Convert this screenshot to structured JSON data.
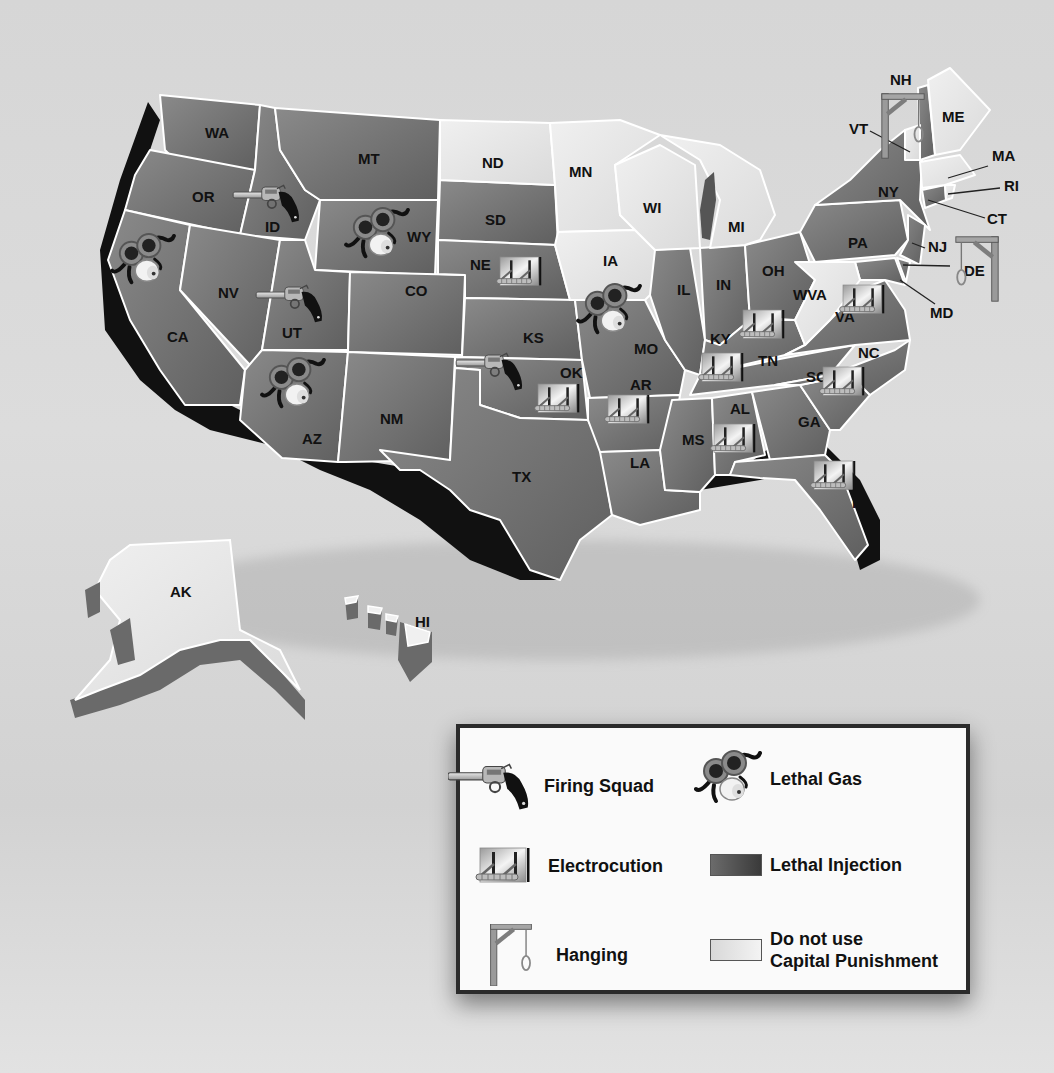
{
  "colors": {
    "background": "#d8d8d8",
    "lethal_injection": "#7d7d7d",
    "lethal_injection_dark": "#5e5e5e",
    "no_capital_punishment": "#e6e6e6",
    "relief_shadow": "#111111",
    "legend_border": "#2b2b2b"
  },
  "map": {
    "states": [
      {
        "abbr": "WA",
        "methods": [
          "lethal_injection"
        ]
      },
      {
        "abbr": "OR",
        "methods": [
          "lethal_injection"
        ]
      },
      {
        "abbr": "CA",
        "methods": [
          "lethal_injection",
          "lethal_gas"
        ]
      },
      {
        "abbr": "ID",
        "methods": [
          "lethal_injection",
          "firing_squad"
        ]
      },
      {
        "abbr": "NV",
        "methods": [
          "lethal_injection"
        ]
      },
      {
        "abbr": "MT",
        "methods": [
          "lethal_injection"
        ]
      },
      {
        "abbr": "WY",
        "methods": [
          "lethal_injection",
          "lethal_gas"
        ]
      },
      {
        "abbr": "UT",
        "methods": [
          "lethal_injection",
          "firing_squad"
        ]
      },
      {
        "abbr": "AZ",
        "methods": [
          "lethal_injection",
          "lethal_gas"
        ]
      },
      {
        "abbr": "CO",
        "methods": [
          "lethal_injection"
        ]
      },
      {
        "abbr": "NM",
        "methods": [
          "lethal_injection"
        ]
      },
      {
        "abbr": "ND",
        "methods": [
          "none"
        ]
      },
      {
        "abbr": "SD",
        "methods": [
          "lethal_injection"
        ]
      },
      {
        "abbr": "NE",
        "methods": [
          "lethal_injection",
          "electrocution"
        ]
      },
      {
        "abbr": "KS",
        "methods": [
          "lethal_injection"
        ]
      },
      {
        "abbr": "OK",
        "methods": [
          "lethal_injection",
          "firing_squad",
          "electrocution"
        ]
      },
      {
        "abbr": "TX",
        "methods": [
          "lethal_injection"
        ]
      },
      {
        "abbr": "MN",
        "methods": [
          "none"
        ]
      },
      {
        "abbr": "IA",
        "methods": [
          "none"
        ]
      },
      {
        "abbr": "MO",
        "methods": [
          "lethal_injection",
          "lethal_gas"
        ]
      },
      {
        "abbr": "AR",
        "methods": [
          "lethal_injection",
          "electrocution"
        ]
      },
      {
        "abbr": "LA",
        "methods": [
          "lethal_injection"
        ]
      },
      {
        "abbr": "WI",
        "methods": [
          "none"
        ]
      },
      {
        "abbr": "IL",
        "methods": [
          "lethal_injection"
        ]
      },
      {
        "abbr": "MI",
        "methods": [
          "none"
        ]
      },
      {
        "abbr": "IN",
        "methods": [
          "lethal_injection"
        ]
      },
      {
        "abbr": "OH",
        "methods": [
          "lethal_injection"
        ]
      },
      {
        "abbr": "KY",
        "methods": [
          "lethal_injection",
          "electrocution"
        ]
      },
      {
        "abbr": "TN",
        "methods": [
          "lethal_injection",
          "electrocution"
        ]
      },
      {
        "abbr": "MS",
        "methods": [
          "lethal_injection"
        ]
      },
      {
        "abbr": "AL",
        "methods": [
          "lethal_injection",
          "electrocution"
        ]
      },
      {
        "abbr": "GA",
        "methods": [
          "lethal_injection"
        ]
      },
      {
        "abbr": "FL",
        "methods": [
          "lethal_injection",
          "electrocution"
        ]
      },
      {
        "abbr": "SC",
        "methods": [
          "lethal_injection",
          "electrocution"
        ]
      },
      {
        "abbr": "NC",
        "methods": [
          "lethal_injection"
        ]
      },
      {
        "abbr": "VA",
        "methods": [
          "lethal_injection",
          "electrocution"
        ]
      },
      {
        "abbr": "WVA",
        "methods": [
          "none"
        ]
      },
      {
        "abbr": "PA",
        "methods": [
          "lethal_injection"
        ]
      },
      {
        "abbr": "NY",
        "methods": [
          "lethal_injection"
        ]
      },
      {
        "abbr": "NJ",
        "methods": [
          "lethal_injection"
        ]
      },
      {
        "abbr": "DE",
        "methods": [
          "lethal_injection",
          "hanging"
        ]
      },
      {
        "abbr": "MD",
        "methods": [
          "lethal_injection"
        ]
      },
      {
        "abbr": "CT",
        "methods": [
          "lethal_injection"
        ]
      },
      {
        "abbr": "RI",
        "methods": [
          "none"
        ]
      },
      {
        "abbr": "MA",
        "methods": [
          "none"
        ]
      },
      {
        "abbr": "VT",
        "methods": [
          "none"
        ]
      },
      {
        "abbr": "NH",
        "methods": [
          "lethal_injection",
          "hanging"
        ]
      },
      {
        "abbr": "ME",
        "methods": [
          "none"
        ]
      },
      {
        "abbr": "AK",
        "methods": [
          "none"
        ]
      },
      {
        "abbr": "HI",
        "methods": [
          "none"
        ]
      }
    ],
    "labels": {
      "WA": "WA",
      "OR": "OR",
      "CA": "CA",
      "ID": "ID",
      "NV": "NV",
      "MT": "MT",
      "WY": "WY",
      "UT": "UT",
      "AZ": "AZ",
      "CO": "CO",
      "NM": "NM",
      "ND": "ND",
      "SD": "SD",
      "NE": "NE",
      "KS": "KS",
      "OK": "OK",
      "TX": "TX",
      "MN": "MN",
      "IA": "IA",
      "MO": "MO",
      "AR": "AR",
      "LA": "LA",
      "WI": "WI",
      "IL": "IL",
      "MI": "MI",
      "IN": "IN",
      "OH": "OH",
      "KY": "KY",
      "TN": "TN",
      "MS": "MS",
      "AL": "AL",
      "GA": "GA",
      "FL": "FL",
      "SC": "SC",
      "NC": "NC",
      "VA": "VA",
      "WVA": "WVA",
      "PA": "PA",
      "NY": "NY",
      "NJ": "NJ",
      "DE": "DE",
      "MD": "MD",
      "CT": "CT",
      "RI": "RI",
      "MA": "MA",
      "VT": "VT",
      "NH": "NH",
      "ME": "ME",
      "AK": "AK",
      "HI": "HI"
    }
  },
  "legend": {
    "items": [
      {
        "key": "firing_squad",
        "icon": "revolver-icon",
        "label": "Firing Squad"
      },
      {
        "key": "lethal_gas",
        "icon": "gas-mask-icon",
        "label": "Lethal Gas"
      },
      {
        "key": "electrocution",
        "icon": "electric-chair-icon",
        "label": "Electrocution"
      },
      {
        "key": "lethal_injection",
        "icon": "dark-swatch",
        "label": "Lethal Injection"
      },
      {
        "key": "hanging",
        "icon": "gallows-icon",
        "label": "Hanging"
      },
      {
        "key": "none",
        "icon": "light-swatch",
        "label_line1": "Do not use",
        "label_line2": "Capital Punishment"
      }
    ]
  }
}
